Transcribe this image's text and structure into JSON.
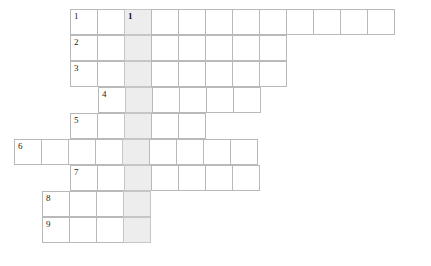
{
  "puzzle": {
    "kind": "crossword-grid",
    "title": "",
    "grid": {
      "cell_width": 28,
      "cell_height": 26,
      "origin_x": 70,
      "origin_y": 9,
      "line_color": "#b9b9b9",
      "cell_color": "#ffffff",
      "shaded_color": "#ededed",
      "shaded_column_index": 2
    },
    "rows": [
      {
        "number": "1",
        "start_col": 0,
        "length": 12,
        "top": 9,
        "shaded_cells": [
          2
        ],
        "numbers": {
          "0": "1",
          "2": "1"
        },
        "letters": {}
      },
      {
        "number": "2",
        "start_col": 0,
        "length": 8,
        "top": 35,
        "shaded_cells": [
          2
        ],
        "numbers": {
          "0": "2"
        },
        "letters": {}
      },
      {
        "number": "3",
        "start_col": 0,
        "length": 8,
        "top": 61,
        "shaded_cells": [
          2
        ],
        "numbers": {
          "0": "3"
        },
        "letters": {}
      },
      {
        "number": "4",
        "start_col": 1,
        "length": 6,
        "top": 87,
        "shaded_cells": [
          1
        ],
        "numbers": {
          "0": "4"
        },
        "letters": {}
      },
      {
        "number": "5",
        "start_col": 0,
        "length": 5,
        "top": 113,
        "shaded_cells": [
          2
        ],
        "numbers": {
          "0": "5"
        },
        "letters": {}
      },
      {
        "number": "6",
        "start_col": -2,
        "length": 9,
        "top": 139,
        "shaded_cells": [
          4
        ],
        "numbers": {
          "0": "6"
        },
        "letters": {}
      },
      {
        "number": "7",
        "start_col": 0,
        "length": 7,
        "top": 165,
        "shaded_cells": [
          2
        ],
        "numbers": {
          "0": "7"
        },
        "letters": {}
      },
      {
        "number": "8",
        "start_col": -1,
        "length": 4,
        "top": 191,
        "shaded_cells": [
          3
        ],
        "numbers": {
          "0": "8"
        },
        "letters": {}
      },
      {
        "number": "9",
        "start_col": -1,
        "length": 4,
        "top": 217,
        "shaded_cells": [
          3
        ],
        "numbers": {
          "0": "9"
        },
        "letters": {}
      }
    ]
  }
}
